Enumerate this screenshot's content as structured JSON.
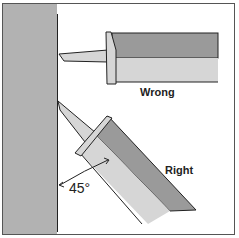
{
  "diagram": {
    "labels": {
      "wrong": "Wrong",
      "right": "Right",
      "angle": "45°"
    },
    "colors": {
      "wall": "#b2b2b2",
      "barrel_dark": "#9a9a9a",
      "barrel_light": "#d6d6d6",
      "outline": "#222222",
      "background": "#ffffff"
    }
  }
}
